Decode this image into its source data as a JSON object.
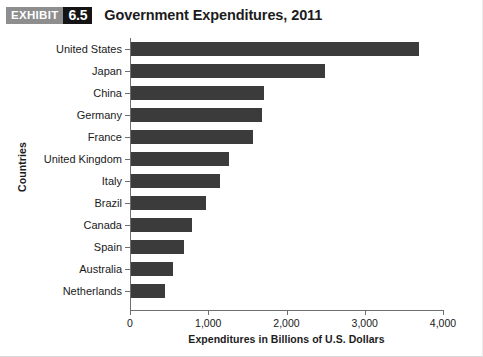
{
  "header": {
    "badge_word": "EXHIBIT",
    "badge_number": "6.5",
    "title": "Government Expenditures, 2011"
  },
  "chart_data": {
    "type": "bar",
    "orientation": "horizontal",
    "title": "Government Expenditures, 2011",
    "xlabel": "Expenditures in Billions of U.S. Dollars",
    "ylabel": "Countries",
    "categories": [
      "United States",
      "Japan",
      "China",
      "Germany",
      "France",
      "United Kingdom",
      "Italy",
      "Brazil",
      "Canada",
      "Spain",
      "Australia",
      "Netherlands"
    ],
    "values": [
      3680,
      2480,
      1700,
      1680,
      1560,
      1250,
      1140,
      960,
      780,
      680,
      540,
      440
    ],
    "xlim": [
      0,
      4000
    ],
    "xticks": [
      0,
      1000,
      2000,
      3000,
      4000
    ],
    "xtick_labels": [
      "0",
      "1,000",
      "2,000",
      "3,000",
      "4,000"
    ],
    "grid": false,
    "legend": null,
    "bar_color": "#3b3b3b",
    "axis_color": "#6f6f6f"
  }
}
